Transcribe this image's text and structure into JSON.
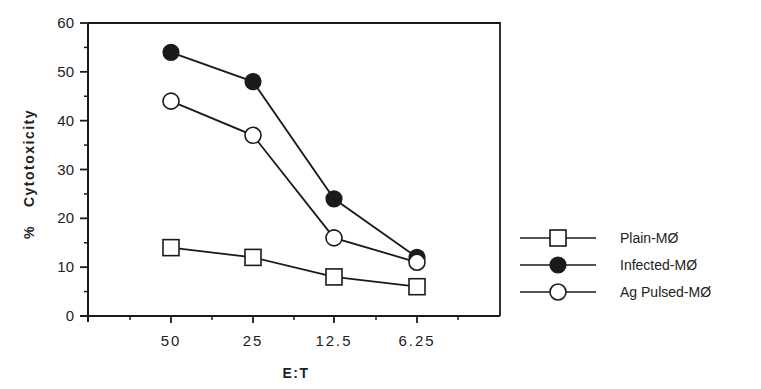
{
  "chart_data": {
    "type": "line",
    "title": "",
    "xlabel": "E:T",
    "ylabel": "% Cytotoxicity",
    "categories": [
      "50",
      "25",
      "12.5",
      "6.25"
    ],
    "ylim": [
      0,
      60
    ],
    "yticks": [
      "0",
      "10",
      "20",
      "30",
      "40",
      "50",
      "60"
    ],
    "grid": false,
    "legend_position": "right",
    "series": [
      {
        "name": "Plain-MØ",
        "marker": "open-square",
        "values": [
          14,
          12,
          8,
          6
        ]
      },
      {
        "name": "Infected-MØ",
        "marker": "filled-circle",
        "values": [
          54,
          48,
          24,
          12
        ]
      },
      {
        "name": "Ag Pulsed-MØ",
        "marker": "open-circle",
        "values": [
          44,
          37,
          16,
          11
        ]
      }
    ]
  },
  "axes": {
    "y_label_pct": "%",
    "y_label_word": "Cytotoxicity",
    "x_label": "E:T"
  },
  "legend": {
    "items": [
      "Plain-MØ",
      "Infected-MØ",
      "Ag Pulsed-MØ"
    ]
  },
  "colors": {
    "ink": "#1a1a1a",
    "background": "#ffffff"
  }
}
